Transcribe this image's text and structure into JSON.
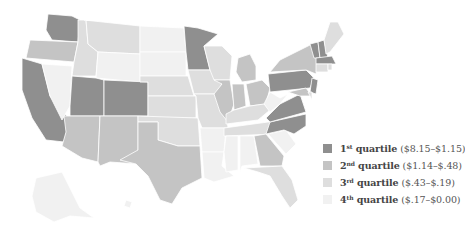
{
  "map": {
    "type": "choropleth",
    "region": "United States",
    "quartile_colors": {
      "q1": "#8f8f8f",
      "q2": "#c4c4c4",
      "q3": "#dedede",
      "q4": "#f1f1f1"
    },
    "states": [
      {
        "id": "WA",
        "q": "q1",
        "points": "48,14 72,16 80,20 78,42 52,40 46,30"
      },
      {
        "id": "OR",
        "q": "q2",
        "points": "30,40 78,42 74,62 26,58"
      },
      {
        "id": "CA",
        "q": "q1",
        "points": "22,58 42,64 50,96 70,120 64,142 46,140 32,118 22,90"
      },
      {
        "id": "ID",
        "q": "q3",
        "points": "78,20 86,20 88,44 98,52 96,76 72,76 74,62 78,42"
      },
      {
        "id": "NV",
        "q": "q4",
        "points": "42,64 72,66 70,106 62,120 50,96"
      },
      {
        "id": "MT",
        "q": "q3",
        "points": "84,20 140,26 140,54 98,52 88,44 86,20"
      },
      {
        "id": "WY",
        "q": "q4",
        "points": "98,52 140,54 140,82 96,78"
      },
      {
        "id": "UT",
        "q": "q1",
        "points": "72,76 96,78 104,80 104,116 70,116 70,106"
      },
      {
        "id": "CO",
        "q": "q1",
        "points": "104,80 148,82 148,116 104,116"
      },
      {
        "id": "AZ",
        "q": "q2",
        "points": "64,116 100,116 98,162 82,158 62,146 66,132"
      },
      {
        "id": "NM",
        "q": "q2",
        "points": "100,116 138,116 138,164 110,162 100,166 98,162"
      },
      {
        "id": "ND",
        "q": "q4",
        "points": "140,26 184,28 186,52 140,52"
      },
      {
        "id": "SD",
        "q": "q4",
        "points": "140,52 186,52 186,76 140,76"
      },
      {
        "id": "NE",
        "q": "q3",
        "points": "140,76 188,76 194,96 148,96 148,82 140,82"
      },
      {
        "id": "KS",
        "q": "q3",
        "points": "148,96 196,96 196,118 148,118"
      },
      {
        "id": "OK",
        "q": "q3",
        "points": "138,116 198,118 200,146 178,146 158,140 158,122 138,122"
      },
      {
        "id": "TX",
        "q": "q2",
        "points": "138,122 158,122 158,140 178,146 200,146 202,178 182,188 172,204 160,200 148,176 136,164 120,160 138,150"
      },
      {
        "id": "MN",
        "q": "q1",
        "points": "184,26 198,28 218,34 204,46 210,70 188,70 186,52"
      },
      {
        "id": "IA",
        "q": "q3",
        "points": "188,70 214,70 222,84 216,94 194,94"
      },
      {
        "id": "MO",
        "q": "q3",
        "points": "194,94 218,94 226,112 228,128 202,128 198,118 196,96"
      },
      {
        "id": "AR",
        "q": "q4",
        "points": "200,128 226,128 224,152 202,152"
      },
      {
        "id": "LA",
        "q": "q4",
        "points": "202,152 224,152 222,166 234,176 214,182 204,178"
      },
      {
        "id": "WI",
        "q": "q3",
        "points": "204,46 222,46 232,56 230,80 214,80 210,70"
      },
      {
        "id": "IL",
        "q": "q2",
        "points": "214,80 230,80 234,104 228,122 220,112 214,94 222,84"
      },
      {
        "id": "MI",
        "q": "q2",
        "points": "238,58 250,54 256,66 256,80 242,82 236,72"
      },
      {
        "id": "IN",
        "q": "q2",
        "points": "232,84 244,84 246,106 234,110"
      },
      {
        "id": "OH",
        "q": "q2",
        "points": "246,84 262,80 270,88 266,104 250,106"
      },
      {
        "id": "KY",
        "q": "q3",
        "points": "226,114 234,110 250,106 264,104 270,110 258,120 226,124"
      },
      {
        "id": "TN",
        "q": "q3",
        "points": "224,128 268,122 284,122 276,134 224,136"
      },
      {
        "id": "MS",
        "q": "q4",
        "points": "226,136 238,136 238,170 226,172 224,152"
      },
      {
        "id": "AL",
        "q": "q4",
        "points": "240,136 254,136 258,164 242,166 240,172"
      },
      {
        "id": "GA",
        "q": "q2",
        "points": "254,136 266,134 284,156 282,166 260,166"
      },
      {
        "id": "FL",
        "q": "q3",
        "points": "244,168 282,166 292,180 298,200 290,208 282,196 270,176 258,172"
      },
      {
        "id": "SC",
        "q": "q4",
        "points": "268,134 286,130 296,144 286,154"
      },
      {
        "id": "NC",
        "q": "q1",
        "points": "270,122 306,114 306,126 294,134 284,130 266,134"
      },
      {
        "id": "VA",
        "q": "q1",
        "points": "266,118 280,104 300,94 306,112 270,122"
      },
      {
        "id": "WV",
        "q": "q4",
        "points": "264,104 270,92 280,98 288,94 280,104 270,112"
      },
      {
        "id": "PA",
        "q": "q1",
        "points": "268,74 306,70 314,78 310,88 270,92"
      },
      {
        "id": "NY",
        "q": "q2",
        "points": "270,72 280,60 296,52 312,44 318,58 316,74 306,70"
      },
      {
        "id": "NJ",
        "q": "q1",
        "points": "312,78 318,80 316,94 310,92"
      },
      {
        "id": "MD",
        "q": "q2",
        "points": "288,92 306,88 312,96 300,96"
      },
      {
        "id": "DE",
        "q": "q3",
        "points": "308,92 312,92 312,100"
      },
      {
        "id": "VT",
        "q": "q1",
        "points": "310,44 318,42 320,58 314,58"
      },
      {
        "id": "NH",
        "q": "q1",
        "points": "318,42 324,40 328,58 320,58"
      },
      {
        "id": "ME",
        "q": "q3",
        "points": "324,40 330,22 338,22 344,34 330,52 326,54"
      },
      {
        "id": "MA",
        "q": "q1",
        "points": "316,58 332,56 336,64 316,64"
      },
      {
        "id": "CT",
        "q": "q3",
        "points": "316,64 328,64 328,72 316,72"
      },
      {
        "id": "RI",
        "q": "q3",
        "points": "328,64 332,64 332,70 328,70"
      },
      {
        "id": "AK",
        "q": "q4",
        "points": "36,178 62,172 70,188 80,208 94,218 70,216 54,222 36,212 32,196"
      },
      {
        "id": "HI",
        "q": "q4",
        "points": "126,200 132,202 130,208 124,206"
      }
    ]
  },
  "legend": {
    "items": [
      {
        "ordinal": "1",
        "suffix": "st",
        "label": "quartile",
        "range": "($8.15–$1.15)",
        "color": "#8f8f8f"
      },
      {
        "ordinal": "2",
        "suffix": "nd",
        "label": "quartile",
        "range": "($1.14–$.48)",
        "color": "#c4c4c4"
      },
      {
        "ordinal": "3",
        "suffix": "rd",
        "label": "quartile",
        "range": "($.43–$.19)",
        "color": "#dedede"
      },
      {
        "ordinal": "4",
        "suffix": "th",
        "label": "quartile",
        "range": "($.17–$0.00)",
        "color": "#f1f1f1"
      }
    ]
  }
}
